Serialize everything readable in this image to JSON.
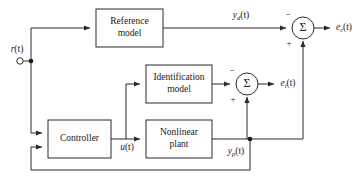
{
  "diagram": {
    "type": "block-diagram",
    "background_color": "#ffffff",
    "line_color": "#2b2b2b",
    "text_color": "#1a1a1a",
    "blocks": [
      {
        "id": "reference-model",
        "line1": "Reference",
        "line2": "model",
        "x": 96,
        "y": 9,
        "w": 67,
        "h": 38
      },
      {
        "id": "identification-model",
        "line1": "Identification",
        "line2": "model",
        "x": 146,
        "y": 65,
        "w": 66,
        "h": 38
      },
      {
        "id": "controller",
        "line1": "Controller",
        "line2": "",
        "x": 48,
        "y": 120,
        "w": 63,
        "h": 38
      },
      {
        "id": "nonlinear-plant",
        "line1": "Nonlinear",
        "line2": "plant",
        "x": 146,
        "y": 120,
        "w": 66,
        "h": 38
      }
    ],
    "summing_junctions": [
      {
        "id": "sum-control-error",
        "glyph": "Σ",
        "cx": 303,
        "cy": 28,
        "r": 11,
        "sign_horizontal": "−",
        "sign_vertical": "+",
        "output_label": "e_c(t)"
      },
      {
        "id": "sum-identification-error",
        "glyph": "Σ",
        "cx": 247,
        "cy": 84,
        "r": 11,
        "sign_horizontal": "−",
        "sign_vertical": "+",
        "output_label": "e_i(t)"
      }
    ],
    "signals": [
      {
        "id": "reference-input",
        "base": "r",
        "sub": "",
        "arg": "(t)",
        "x": 17,
        "y": 60
      },
      {
        "id": "desired-output",
        "base": "y",
        "sub": "d",
        "arg": "(t)",
        "x": 241,
        "y": 16
      },
      {
        "id": "control-error-output",
        "base": "e",
        "sub": "c",
        "arg": "(t)",
        "x": 344,
        "y": 28
      },
      {
        "id": "identification-error",
        "base": "e",
        "sub": "i",
        "arg": "(t)",
        "x": 288,
        "y": 84
      },
      {
        "id": "control-signal",
        "base": "u",
        "sub": "",
        "arg": "(t)",
        "x": 127,
        "y": 146
      },
      {
        "id": "plant-output",
        "base": "y",
        "sub": "p",
        "arg": "(t)",
        "x": 236,
        "y": 152
      }
    ],
    "nodes": [
      {
        "id": "reference-split-node",
        "cx": 31,
        "cy": 61
      },
      {
        "id": "plant-output-node",
        "cx": 250,
        "cy": 139
      },
      {
        "id": "reference-terminal",
        "cx": 20,
        "cy": 61,
        "r": 3.2
      }
    ]
  }
}
